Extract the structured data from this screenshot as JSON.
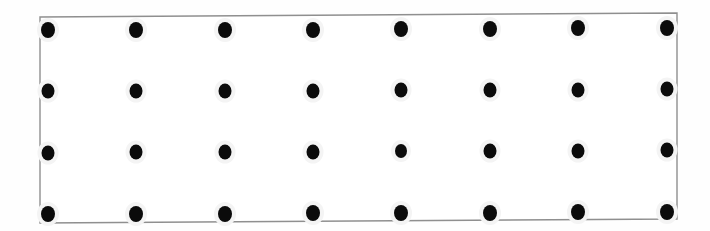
{
  "image": {
    "title": "Dot grid calibration target",
    "description": "A rectangular white board with a thin gray outline containing a regular grid of solid black circular dots, photographed with a very slight rotation.",
    "background_color": "#ffffff",
    "paper_color": "#fefefe"
  },
  "board": {
    "name": "calibration-board",
    "border_color": "#8f8f8f",
    "border_width_px": 1.4,
    "fill_color": "#ffffff",
    "rotation_deg": -0.35,
    "corners": {
      "top_left": {
        "x": 40,
        "y": 17
      },
      "top_right": {
        "x": 677,
        "y": 13
      },
      "bottom_right": {
        "x": 677,
        "y": 219
      },
      "bottom_left": {
        "x": 40,
        "y": 223
      }
    }
  },
  "grid": {
    "name": "dot-grid",
    "columns": 8,
    "rows": 4,
    "dot_color": "#0b0b0b",
    "dot_halo_color": "#f4f4f4",
    "dot_diameter_x_px": 13,
    "dot_diameter_y_px": 15,
    "column_spacing_px": 88.4,
    "row_spacing_px": 61.3,
    "column_centers_x": [
      48,
      136,
      225,
      313,
      401,
      490,
      578,
      667
    ],
    "row_centers_y": [
      30,
      91,
      152,
      214
    ],
    "total_dots": 32,
    "dots": [
      {
        "row": 0,
        "col": 0,
        "x": 48,
        "y": 30,
        "w": 14,
        "h": 16
      },
      {
        "row": 0,
        "col": 1,
        "x": 136,
        "y": 30,
        "w": 14,
        "h": 16
      },
      {
        "row": 0,
        "col": 2,
        "x": 225,
        "y": 30,
        "w": 14,
        "h": 16
      },
      {
        "row": 0,
        "col": 3,
        "x": 313,
        "y": 30,
        "w": 14,
        "h": 16
      },
      {
        "row": 0,
        "col": 4,
        "x": 401,
        "y": 29,
        "w": 14,
        "h": 16
      },
      {
        "row": 0,
        "col": 5,
        "x": 490,
        "y": 29,
        "w": 14,
        "h": 16
      },
      {
        "row": 0,
        "col": 6,
        "x": 578,
        "y": 28,
        "w": 14,
        "h": 16
      },
      {
        "row": 0,
        "col": 7,
        "x": 667,
        "y": 28,
        "w": 14,
        "h": 16
      },
      {
        "row": 1,
        "col": 0,
        "x": 48,
        "y": 91,
        "w": 13,
        "h": 15
      },
      {
        "row": 1,
        "col": 1,
        "x": 136,
        "y": 91,
        "w": 13,
        "h": 15
      },
      {
        "row": 1,
        "col": 2,
        "x": 225,
        "y": 91,
        "w": 13,
        "h": 15
      },
      {
        "row": 1,
        "col": 3,
        "x": 313,
        "y": 91,
        "w": 13,
        "h": 15
      },
      {
        "row": 1,
        "col": 4,
        "x": 401,
        "y": 90,
        "w": 13,
        "h": 15
      },
      {
        "row": 1,
        "col": 5,
        "x": 490,
        "y": 90,
        "w": 13,
        "h": 15
      },
      {
        "row": 1,
        "col": 6,
        "x": 578,
        "y": 90,
        "w": 13,
        "h": 15
      },
      {
        "row": 1,
        "col": 7,
        "x": 667,
        "y": 89,
        "w": 13,
        "h": 15
      },
      {
        "row": 2,
        "col": 0,
        "x": 48,
        "y": 153,
        "w": 13,
        "h": 15
      },
      {
        "row": 2,
        "col": 1,
        "x": 136,
        "y": 152,
        "w": 13,
        "h": 15
      },
      {
        "row": 2,
        "col": 2,
        "x": 225,
        "y": 152,
        "w": 13,
        "h": 15
      },
      {
        "row": 2,
        "col": 3,
        "x": 313,
        "y": 152,
        "w": 13,
        "h": 15
      },
      {
        "row": 2,
        "col": 4,
        "x": 401,
        "y": 151,
        "w": 12,
        "h": 14
      },
      {
        "row": 2,
        "col": 5,
        "x": 490,
        "y": 151,
        "w": 13,
        "h": 15
      },
      {
        "row": 2,
        "col": 6,
        "x": 578,
        "y": 151,
        "w": 13,
        "h": 15
      },
      {
        "row": 2,
        "col": 7,
        "x": 667,
        "y": 150,
        "w": 13,
        "h": 15
      },
      {
        "row": 3,
        "col": 0,
        "x": 48,
        "y": 214,
        "w": 14,
        "h": 16
      },
      {
        "row": 3,
        "col": 1,
        "x": 136,
        "y": 214,
        "w": 14,
        "h": 16
      },
      {
        "row": 3,
        "col": 2,
        "x": 225,
        "y": 214,
        "w": 14,
        "h": 16
      },
      {
        "row": 3,
        "col": 3,
        "x": 313,
        "y": 213,
        "w": 14,
        "h": 16
      },
      {
        "row": 3,
        "col": 4,
        "x": 401,
        "y": 213,
        "w": 14,
        "h": 16
      },
      {
        "row": 3,
        "col": 5,
        "x": 490,
        "y": 213,
        "w": 14,
        "h": 16
      },
      {
        "row": 3,
        "col": 6,
        "x": 578,
        "y": 212,
        "w": 14,
        "h": 16
      },
      {
        "row": 3,
        "col": 7,
        "x": 667,
        "y": 212,
        "w": 14,
        "h": 16
      }
    ]
  }
}
